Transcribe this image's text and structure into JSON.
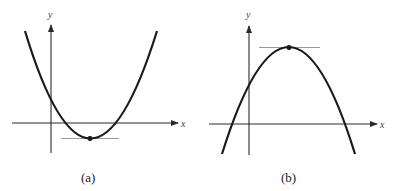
{
  "panels": [
    {
      "id": "a",
      "caption": "(a)",
      "x_axis_label": "x",
      "y_axis_label": "y",
      "curve": "upward-opening parabola",
      "feature": "minimum point with horizontal tangent line"
    },
    {
      "id": "b",
      "caption": "(b)",
      "x_axis_label": "x",
      "y_axis_label": "y",
      "curve": "downward-opening parabola",
      "feature": "maximum point with horizontal tangent line"
    }
  ],
  "colors": {
    "curve": "#1a1a1a",
    "axis": "#2a2a2a",
    "tangent": "#9a9a9a",
    "background": "#ffffff"
  }
}
